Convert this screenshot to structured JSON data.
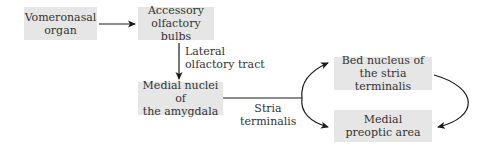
{
  "diagram": {
    "nodes": [
      {
        "id": "vno",
        "label_line1": "Vomeronasal",
        "label_line2": "organ"
      },
      {
        "id": "aob",
        "label_line1": "Accessory",
        "label_line2": "olfactory bulbs"
      },
      {
        "id": "mea",
        "label_line1": "Medial nuclei of",
        "label_line2": "the amygdala"
      },
      {
        "id": "bnst",
        "label_line1": "Bed nucleus of",
        "label_line2": "the stria terminalis"
      },
      {
        "id": "mpoa",
        "label_line1": "Medial",
        "label_line2": "preoptic area"
      }
    ],
    "edge_labels": {
      "lot_line1": "Lateral",
      "lot_line2": "olfactory tract",
      "st_line1": "Stria",
      "st_line2": "terminalis"
    },
    "edges": [
      {
        "from": "vno",
        "to": "aob"
      },
      {
        "from": "aob",
        "to": "mea",
        "label": "Lateral olfactory tract"
      },
      {
        "from": "mea",
        "to": "bnst",
        "label": "Stria terminalis"
      },
      {
        "from": "mea",
        "to": "mpoa",
        "label": "Stria terminalis"
      },
      {
        "from": "bnst",
        "to": "mpoa"
      }
    ],
    "colors": {
      "box_fill": "#e6e6e6",
      "arrow": "#1a1a1a",
      "text": "#333333"
    }
  }
}
